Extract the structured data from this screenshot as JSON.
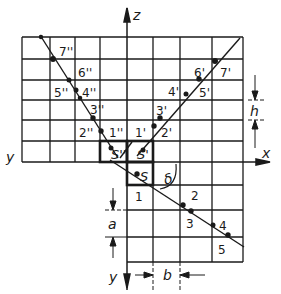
{
  "diagram": {
    "colors": {
      "ink": "#1a1a1a",
      "background": "#ffffff"
    },
    "axes": {
      "z_label": "z",
      "x_label": "x",
      "y_left_label": "y",
      "y_bottom_label": "y"
    },
    "dimensions": {
      "h": "h",
      "a": "a",
      "b": "b",
      "angle": "δ"
    },
    "sources": {
      "s": "S",
      "s_prime": "S'",
      "s_double_prime": "S''"
    },
    "points_double_prime": [
      {
        "label": "1''"
      },
      {
        "label": "2''"
      },
      {
        "label": "3''"
      },
      {
        "label": "4''"
      },
      {
        "label": "5''"
      },
      {
        "label": "6''"
      },
      {
        "label": "7''"
      }
    ],
    "points_prime": [
      {
        "label": "1'"
      },
      {
        "label": "2'"
      },
      {
        "label": "3'"
      },
      {
        "label": "4'"
      },
      {
        "label": "5'"
      },
      {
        "label": "6'"
      },
      {
        "label": "7'"
      }
    ],
    "points_plan": [
      {
        "label": "1"
      },
      {
        "label": "2"
      },
      {
        "label": "3"
      },
      {
        "label": "4"
      },
      {
        "label": "5"
      }
    ]
  }
}
